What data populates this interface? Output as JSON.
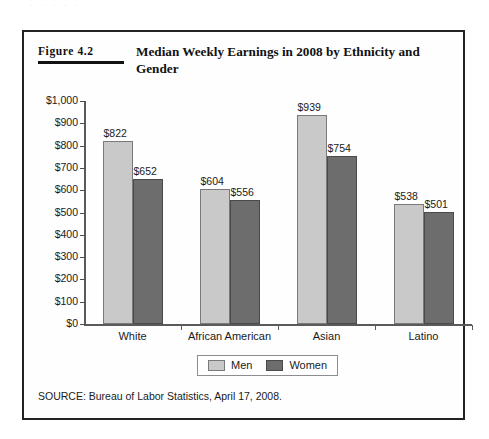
{
  "page_top_sliver": "· ·   ·    ·     ·",
  "figure": {
    "label_word": "Figure",
    "number": "4.2",
    "title": "Median Weekly Earnings in 2008 by Ethnicity and Gender",
    "source": "SOURCE: Bureau of Labor Statistics, April 17, 2008."
  },
  "legend": {
    "items": [
      {
        "label": "Men",
        "color": "#c9c9c9"
      },
      {
        "label": "Women",
        "color": "#6d6d6d"
      }
    ]
  },
  "chart_data": {
    "type": "bar",
    "title": "Median Weekly Earnings in 2008 by Ethnicity and Gender",
    "xlabel": "",
    "ylabel": "",
    "ylim": [
      0,
      1000
    ],
    "grid": false,
    "legend_position": "bottom",
    "categories": [
      "White",
      "African American",
      "Asian",
      "Latino"
    ],
    "ytick_labels": [
      "$1,000",
      "$900",
      "$800",
      "$700",
      "$600",
      "$500",
      "$400",
      "$300",
      "$200",
      "$100",
      "$0"
    ],
    "ytick_values": [
      1000,
      900,
      800,
      700,
      600,
      500,
      400,
      300,
      200,
      100,
      0
    ],
    "series": [
      {
        "name": "Men",
        "color": "#c9c9c9",
        "values": [
          822,
          604,
          939,
          538
        ],
        "data_labels": [
          "$822",
          "$604",
          "$939",
          "$538"
        ]
      },
      {
        "name": "Women",
        "color": "#6d6d6d",
        "values": [
          652,
          556,
          754,
          501
        ],
        "data_labels": [
          "$652",
          "$556",
          "$754",
          "$501"
        ]
      }
    ]
  }
}
